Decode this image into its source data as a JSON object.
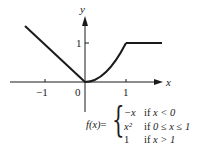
{
  "diagram": {
    "type": "piecewise-function-graph",
    "axes": {
      "x_label": "x",
      "y_label": "y",
      "x_ticks": [
        {
          "value": -1,
          "label": "−1"
        },
        {
          "value": 0,
          "label": "0"
        },
        {
          "value": 1,
          "label": "1"
        }
      ],
      "y_ticks": [
        {
          "value": 1,
          "label": "1"
        }
      ]
    },
    "curve": {
      "segments": [
        {
          "piece": "-x",
          "domain": "x < 0",
          "x_range": [
            -1.5,
            0
          ]
        },
        {
          "piece": "x^2",
          "domain": "0 ≤ x ≤ 1",
          "x_range": [
            0,
            1
          ]
        },
        {
          "piece": "1",
          "domain": "x > 1",
          "x_range": [
            1,
            1.9
          ]
        }
      ]
    },
    "formula": {
      "lhs": "f(x)",
      "eq": "=",
      "cases": [
        {
          "expr": "−x",
          "cond_prefix": "if ",
          "cond": "x < 0"
        },
        {
          "expr": "x²",
          "cond_prefix": "if ",
          "cond": "0 ≤ x ≤ 1"
        },
        {
          "expr": "1",
          "cond_prefix": "if ",
          "cond": "x > 1"
        }
      ]
    }
  }
}
